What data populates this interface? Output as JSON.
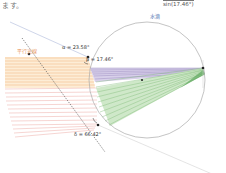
{
  "header": {
    "top_text": "ます。",
    "formula_numerator": "",
    "formula_denominator": "sin(17.46°)",
    "formula_right": "= 1.33"
  },
  "diagram": {
    "labels": {
      "drop": "水滴",
      "parallel_rays": "平行光線",
      "alpha": "α = 23.58°",
      "beta": "β = 17.46°",
      "delta": "δ = 66.42°"
    },
    "colors": {
      "incident_rays": "#f0b27a",
      "incident_fill": "#fde8cc",
      "lower_rays": "#e8908a",
      "refracted_purple": "#8f7fb8",
      "refracted_fill": "#d8d0ea",
      "refracted_green": "#5fa85f",
      "green_fill": "#cfe8c9",
      "circle": "#999999",
      "dotted_line": "#555555",
      "label_blue": "#4a6fb0",
      "label_orange": "#e8955a"
    },
    "circle": {
      "cx": 147,
      "cy": 79,
      "r": 58
    },
    "points": [
      {
        "name": "entry",
        "x": 90,
        "y": 68
      },
      {
        "name": "center",
        "x": 142,
        "y": 79
      },
      {
        "name": "exit",
        "x": 203,
        "y": 68
      },
      {
        "name": "lower-exit",
        "x": 98,
        "y": 125
      },
      {
        "name": "line-point",
        "x": 30,
        "y": 54
      }
    ]
  }
}
